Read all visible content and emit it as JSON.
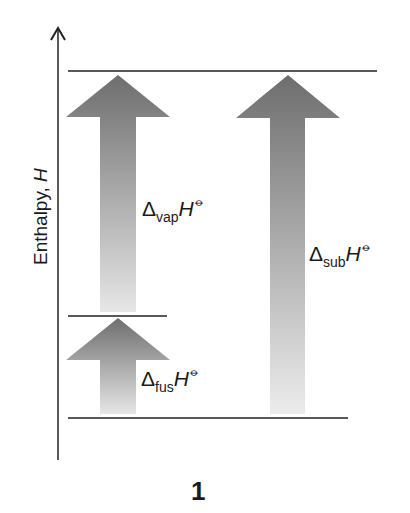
{
  "axis": {
    "label": "Enthalpy, ",
    "label_symbol": "H"
  },
  "levels": [
    {
      "name": "vapour",
      "y": 71
    },
    {
      "name": "liquid",
      "y": 316
    },
    {
      "name": "solid",
      "y": 418
    }
  ],
  "arrows": [
    {
      "id": "vap",
      "delta": "Δ",
      "subscript": "vap",
      "symbol": "H",
      "standard": "⦵"
    },
    {
      "id": "fus",
      "delta": "Δ",
      "subscript": "fus",
      "symbol": "H",
      "standard": "⦵"
    },
    {
      "id": "sub",
      "delta": "Δ",
      "subscript": "sub",
      "symbol": "H",
      "standard": "⦵"
    }
  ],
  "caption": "1"
}
